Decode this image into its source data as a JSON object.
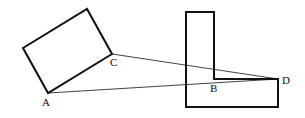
{
  "diagram": {
    "colors": {
      "stroke": "#111111",
      "background": "#ffffff"
    },
    "rectangle": {
      "points": "23,48 87,9 112,54 48,93"
    },
    "l_shape": {
      "points": "186,12 214,12 214,79 278,79 278,107 186,107"
    },
    "lines": [
      {
        "from": "C",
        "to": "D",
        "x1": 112,
        "y1": 54,
        "x2": 278,
        "y2": 79
      },
      {
        "from": "A",
        "to": "D",
        "x1": 48,
        "y1": 93,
        "x2": 278,
        "y2": 79
      }
    ],
    "labels": {
      "A": {
        "text": "A",
        "x": 42,
        "y": 106
      },
      "B": {
        "text": "B",
        "x": 210,
        "y": 92
      },
      "C": {
        "text": "C",
        "x": 110,
        "y": 66
      },
      "D": {
        "text": "D",
        "x": 282,
        "y": 84
      }
    }
  }
}
